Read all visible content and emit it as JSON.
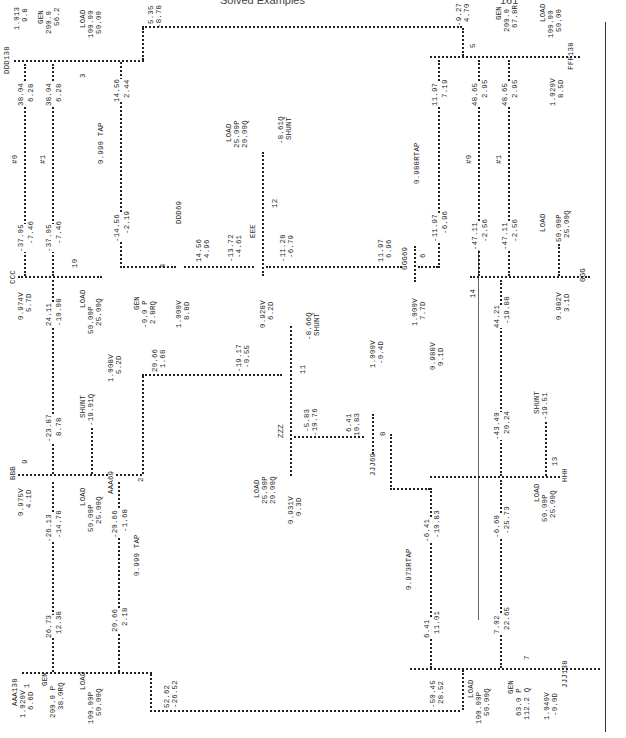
{
  "header": {
    "title": "Solved Examples",
    "page_number": "161"
  },
  "diagram": {
    "buses": {
      "AAA138": {
        "name": "AAA138",
        "voltage": "1.020V",
        "angle": "6.6D",
        "gen_label": "GEN",
        "gen_p": "200.0 P",
        "gen_q": "38.0RQ",
        "load_label": "LOAD",
        "load_p": "100.00P",
        "load_q": "50.00Q",
        "bus_no": "1"
      },
      "BBB": {
        "name": "BBB",
        "voltage": "0.975V",
        "angle": "4.1D",
        "load_label": "LOAD",
        "load_p": "50.00P",
        "load_q": "25.00Q",
        "shunt_label": "SHUNT",
        "shunt_q": "-19.01Q",
        "bus_no": "9"
      },
      "AAA69": {
        "name": "AAA69",
        "voltage": "1.008V",
        "angle": "5.2D",
        "bus_no": "2"
      },
      "CCC": {
        "name": "CCC",
        "voltage": "0.974V",
        "angle": "5.7D",
        "load_label": "LOAD",
        "load_p": "50.00P",
        "load_q": "25.00Q",
        "bus_no": "10"
      },
      "DDD138": {
        "name": "DDD138",
        "voltage": "1.013",
        "angle": "9.8",
        "gen_label": "GEN",
        "gen_p": "200.0",
        "gen_q": "56.2",
        "load_label": "LOAD",
        "load_p": "100.00",
        "load_q": "50.00",
        "bus_no": "3"
      },
      "DDD69": {
        "name": "DDD69",
        "voltage": "1.000V",
        "angle": "8.8D",
        "gen_label": "GEN",
        "gen_p": "-0.0 P",
        "gen_q": "2.8RQ",
        "bus_no": "4"
      },
      "EEE": {
        "name": "EEE",
        "voltage": "0.928V",
        "angle": "6.2D",
        "load_label": "LOAD",
        "load_p": "25.00P",
        "load_q": "20.00Q",
        "shunt_label": "SHUNT",
        "shunt_q": "-8.61Q",
        "bus_no": "12"
      },
      "ZZZ": {
        "name": "ZZZ",
        "voltage": "0.931V",
        "angle": "0.3D",
        "load_label": "LOAD",
        "load_p": "25.00P",
        "load_q": "20.00Q",
        "shunt_label": "SHUNT",
        "shunt_q": "-8.66Q",
        "bus_no": "11"
      },
      "GGG69": {
        "name": "GGG69",
        "voltage": "1.000V",
        "angle": "7.7D",
        "bus_no": "6"
      },
      "GGG": {
        "name": "GGG",
        "voltage": "0.982V",
        "angle": "3.1D",
        "load_label": "LOAD",
        "load_p": "50.00P",
        "load_q": "25.00Q",
        "bus_no": "14"
      },
      "FFF138": {
        "name": "FFF138",
        "voltage": "1.020V",
        "angle": "8.5D",
        "gen_label": "GEN",
        "gen_p": "200.0",
        "gen_q": "67.8R",
        "load_label": "LOAD",
        "load_p": "100.00",
        "load_q": "50.00",
        "bus_no": "5"
      },
      "JJJ69": {
        "name": "JJJ69",
        "voltage": "1.000V",
        "angle": "-0.4D",
        "bus_no": "8"
      },
      "HHH": {
        "name": "HHH",
        "voltage": "0.988V",
        "angle": "0.1D",
        "load_label": "LOAD",
        "load_p": "50.00P",
        "load_q": "25.00Q",
        "shunt_label": "SHUNT",
        "shunt_q": "-19.51",
        "bus_no": "13"
      },
      "JJJ138": {
        "name": "JJJ138",
        "voltage": "1.040V",
        "angle": "-0.0D",
        "gen_label": "GEN",
        "gen_p": "63.0 P",
        "gen_q": "112.2 Q",
        "load_label": "LOAD",
        "load_p": "100.00P",
        "load_q": "50.00Q",
        "bus_no": "7"
      }
    },
    "flows": {
      "aaa_bbb": {
        "p_from": "26.73",
        "q_from": "12.38",
        "p_to": "-26.13",
        "q_to": "-14.78"
      },
      "bbb_ccc": {
        "p_from": "-23.87",
        "q_from": "8.78",
        "p_to": "24.11",
        "q_to": "-10.08"
      },
      "ccc_ddd_0": {
        "tag": "#0",
        "p_from": "-37.05",
        "q_from": "-7.46",
        "p_to": "38.04",
        "q_to": "6.28"
      },
      "ccc_ddd_1": {
        "tag": "#1",
        "p_from": "-37.05",
        "q_from": "-7.46",
        "p_to": "38.04",
        "q_to": "6.28"
      },
      "ddd_tap": {
        "tap": "0.990 TAP",
        "p_from": "-14.56",
        "q_from": "-2.19",
        "p_to": "14.56",
        "q_to": "2.44"
      },
      "ddd69_eee": {
        "p_from": "14.56",
        "q_from": "4.96",
        "p_to": "-13.72",
        "q_to": "-4.61"
      },
      "eee_ggg": {
        "p_from": "-11.28",
        "q_from": "-6.79",
        "p_to": "11.97",
        "q_to": "6.96"
      },
      "ddd_fff": {
        "p_from": "5.35",
        "q_from": "-8.78",
        "p_to": "-9.27",
        "q_to": "4.70"
      },
      "ggg_rtap": {
        "tap": "0.988RTAP",
        "p_from": "-11.97",
        "q_from": "-6.96",
        "p_to": "11.97",
        "q_to": "7.19"
      },
      "ggg_fff_0": {
        "tag": "#0",
        "p_from": "-47.11",
        "q_from": "-2.56",
        "p_to": "48.65",
        "q_to": "2.95"
      },
      "ggg_fff_1": {
        "tag": "#1",
        "p_from": "-47.11",
        "q_from": "-2.56",
        "p_to": "48.65",
        "q_to": "2.95"
      },
      "aaa_tap": {
        "tap": "0.990 TAP",
        "p_from": "20.66",
        "q_from": "2.18",
        "p_to": "-20.66",
        "q_to": "-1.68"
      },
      "aaa69_zzz": {
        "p_from": "20.66",
        "q_from": "1.68",
        "p_to": "-19.17",
        "q_to": "-0.55"
      },
      "zzz_jjj": {
        "p_from": "-5.83",
        "q_from": "-10.76",
        "p_to": "6.41",
        "q_to": "10.83"
      },
      "jjj_rtap": {
        "tap": "0.973RTAP",
        "p_from": "6.41",
        "q_from": "11.01",
        "p_to": "-6.41",
        "q_to": "-10.83"
      },
      "jjj_hhh": {
        "p_from": "7.02",
        "q_from": "22.65",
        "p_to": "-6.60",
        "q_to": "-25.73"
      },
      "hhh_ggg": {
        "p_from": "-43.40",
        "q_from": "20.24",
        "p_to": "44.21",
        "q_to": "-19.88"
      },
      "aaa_jjj": {
        "p_from": "52.62",
        "q_from": "-26.52",
        "p_to": "-50.45",
        "q_to": "28.52"
      }
    }
  }
}
